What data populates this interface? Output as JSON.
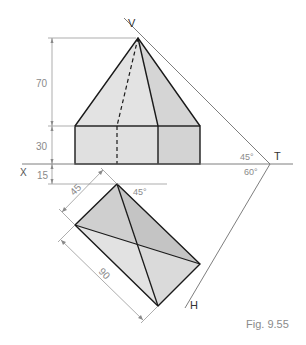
{
  "figure": {
    "caption": "Fig. 9.55",
    "colors": {
      "background": "#ffffff",
      "outline": "#1a1a1a",
      "thin_line": "#6f6f6f",
      "dim_text": "#8a8a8a",
      "fill_light": "#e2e2e2",
      "fill_mid": "#d6d6d6",
      "fill_dark": "#c4c4c4"
    },
    "labels": {
      "apex": "V",
      "x_axis": "X",
      "trace_top": "T",
      "trace_bottom": "H"
    },
    "dimensions": {
      "pyramid_height": "70",
      "prism_height": "30",
      "plan_offset": "15",
      "plan_width": "45",
      "plan_length": "90"
    },
    "angles": {
      "vt_angle": "45°",
      "ht_angle": "60°",
      "plan_angle": "45°"
    }
  }
}
